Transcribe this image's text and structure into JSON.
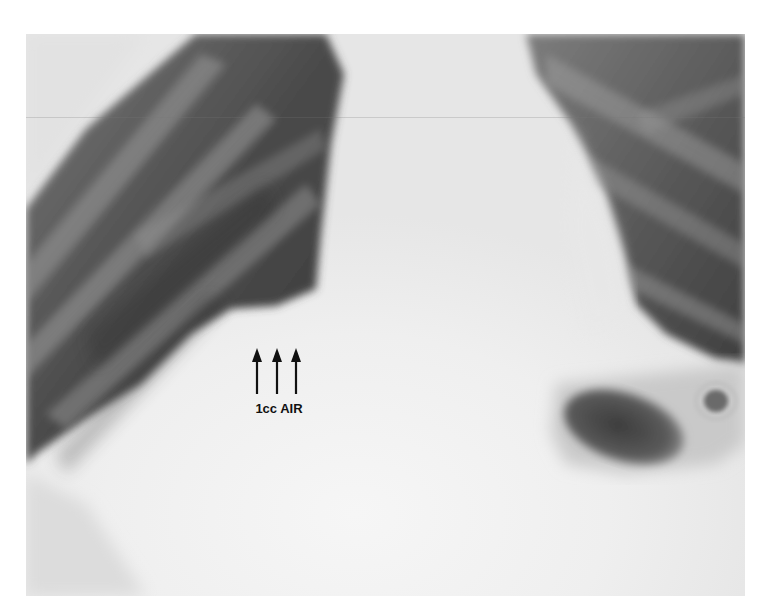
{
  "image": {
    "type": "chest radiograph (X-ray)",
    "region": "lower chest / upper abdomen",
    "background_color": "#ffffff",
    "film_bounds": {
      "x": 26,
      "y": 34,
      "width": 719,
      "height": 562
    }
  },
  "annotation": {
    "label": "1cc AIR",
    "arrow_count": 3,
    "arrow_direction": "up",
    "color": "#111111"
  },
  "structures": [
    {
      "name": "left-lung-field",
      "appearance": "dark with rib shadows"
    },
    {
      "name": "right-lung-field",
      "appearance": "dark with rib shadows"
    },
    {
      "name": "mediastinum-heart",
      "appearance": "bright white"
    },
    {
      "name": "diaphragm",
      "appearance": "bright white"
    },
    {
      "name": "gastric-air-bubble",
      "appearance": "dark oval lucency"
    }
  ]
}
